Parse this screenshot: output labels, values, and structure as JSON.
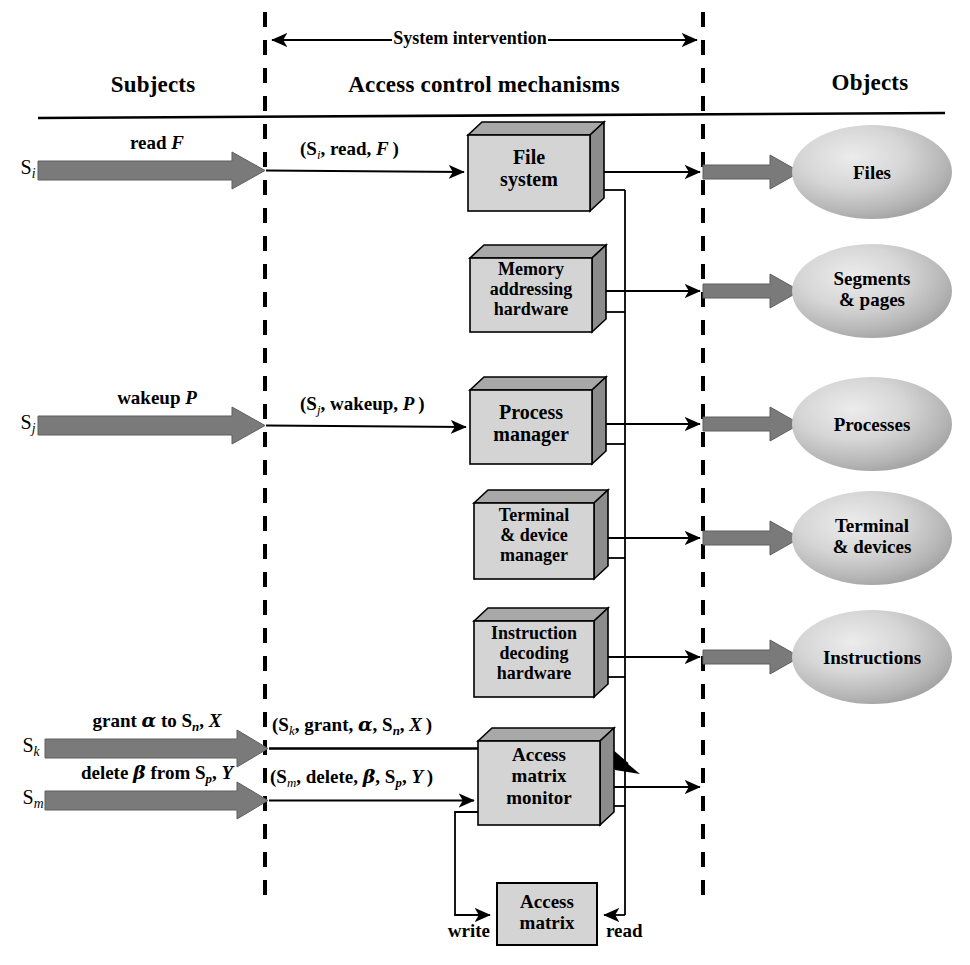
{
  "figure": {
    "columns": [
      {
        "id": "subjects",
        "label": "Subjects"
      },
      {
        "id": "mechanisms",
        "label": "Access control mechanisms"
      },
      {
        "id": "objects",
        "label": "Objects"
      }
    ],
    "span_label": "System intervention",
    "colors": {
      "box_face": "#d4d4d4",
      "box_top": "#a8a8a8",
      "box_side": "#8c8c8c",
      "thick_arrow": "#7a7a7a",
      "ellipse_light": "#e6e6e6",
      "ellipse_dark": "#9a9a9a",
      "line": "#000000"
    }
  },
  "subjects": [
    {
      "id": "s-i",
      "name": "S",
      "subscript": "i",
      "request": {
        "verb": "read",
        "operand": "F",
        "text": "read F"
      },
      "tuple": "(S_i, read, F )"
    },
    {
      "id": "s-j",
      "name": "S",
      "subscript": "j",
      "request": {
        "verb": "wakeup",
        "operand": "P",
        "text": "wakeup P"
      },
      "tuple": "(S_j, wakeup, P )"
    },
    {
      "id": "s-k",
      "name": "S",
      "subscript": "k",
      "request": {
        "verb": "grant",
        "operand": "α to S_n, X",
        "text": "grant α to S_n, X"
      },
      "tuple": "(S_k, grant, α, S_n, X )"
    },
    {
      "id": "s-m",
      "name": "S",
      "subscript": "m",
      "request": {
        "verb": "delete",
        "operand": "β from S_p, Y",
        "text": "delete β from S_p, Y"
      },
      "tuple": "(S_m, delete, β, S_p, Y )"
    }
  ],
  "mechanisms": [
    {
      "id": "file-system",
      "lines": [
        "File",
        "system"
      ]
    },
    {
      "id": "memory-addressing",
      "lines": [
        "Memory",
        "addressing",
        "hardware"
      ]
    },
    {
      "id": "process-manager",
      "lines": [
        "Process",
        "manager"
      ]
    },
    {
      "id": "terminal-device",
      "lines": [
        "Terminal",
        "& device",
        "manager"
      ]
    },
    {
      "id": "instruction-decode",
      "lines": [
        "Instruction",
        "decoding",
        "hardware"
      ]
    },
    {
      "id": "access-matrix-monitor",
      "lines": [
        "Access",
        "matrix",
        "monitor"
      ]
    }
  ],
  "store": {
    "id": "access-matrix",
    "lines": [
      "Access",
      "matrix"
    ],
    "write_label": "write",
    "read_label": "read"
  },
  "objects": [
    {
      "id": "files",
      "lines": [
        "Files"
      ]
    },
    {
      "id": "segments-pages",
      "lines": [
        "Segments",
        "& pages"
      ]
    },
    {
      "id": "processes",
      "lines": [
        "Processes"
      ]
    },
    {
      "id": "terminal-devices",
      "lines": [
        "Terminal",
        "& devices"
      ]
    },
    {
      "id": "instructions",
      "lines": [
        "Instructions"
      ]
    }
  ]
}
